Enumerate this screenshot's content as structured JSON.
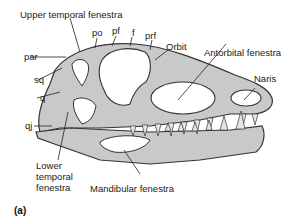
{
  "figure": {
    "panel_label": "(a)",
    "colors": {
      "bone": "#c9c9c9",
      "bone_dark": "#9a9a9a",
      "outline": "#333333",
      "background": "#ffffff"
    }
  },
  "labels": {
    "upper_temporal_fenestra": "Upper temporal fenestra",
    "po": "po",
    "pf": "pf",
    "f": "f",
    "prf": "prf",
    "orbit": "Orbit",
    "antorbital_fenestra": "Antorbital fenestra",
    "naris": "Naris",
    "par": "par",
    "sq": "sq",
    "q": "q",
    "qj": "qj",
    "lower_temporal_fenestra_1": "Lower",
    "lower_temporal_fenestra_2": "temporal",
    "lower_temporal_fenestra_3": "fenestra",
    "mandibular_fenestra": "Mandibular fenestra"
  }
}
